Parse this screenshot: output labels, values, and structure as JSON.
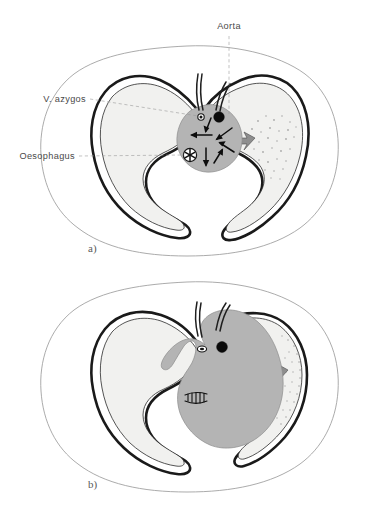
{
  "figure": {
    "type": "anatomical-cross-section",
    "background_color": "#ffffff",
    "line_color": "#1a1a1a",
    "lung_fill_color": "#f1f1ef",
    "mass_fill_color": "#b4b4b4",
    "chest_wall_color": "#9c9c9c",
    "label_text_color": "#4a4a4a"
  },
  "labels": {
    "aorta": "Aorta",
    "v_azygos": "V. azygos",
    "oesophagus": "Oesophagus"
  },
  "panels": [
    {
      "id": "a",
      "caption": "a)",
      "description": "Normal mediastinum with compressive arrows directed inward toward the central mass; right lung shows stippled infiltration.",
      "arrow_count": 6,
      "structures": [
        {
          "name": "aorta",
          "marker": "filled-black-circle"
        },
        {
          "name": "v-azygos",
          "marker": "small-ringed-circle"
        },
        {
          "name": "oesophagus",
          "marker": "asterisk-in-circle"
        },
        {
          "name": "mediastinal-mass",
          "marker": "grey-lobulated-blob"
        },
        {
          "name": "stippled-infiltrate",
          "marker": "dot-stipple-field"
        }
      ]
    },
    {
      "id": "b",
      "caption": "b)",
      "description": "Enlarged mediastinal mass expanding into the right hemithorax, compressing the right lung into a thin crescent and flattening the oesophagus into a slit.",
      "arrow_count": 0,
      "structures": [
        {
          "name": "aorta",
          "marker": "filled-black-circle"
        },
        {
          "name": "v-azygos",
          "marker": "compressed-oval"
        },
        {
          "name": "oesophagus",
          "marker": "flattened-slit"
        },
        {
          "name": "mediastinal-mass",
          "marker": "expanded-grey-mass"
        },
        {
          "name": "stippled-infiltrate",
          "marker": "compressed-dot-band"
        }
      ]
    }
  ]
}
